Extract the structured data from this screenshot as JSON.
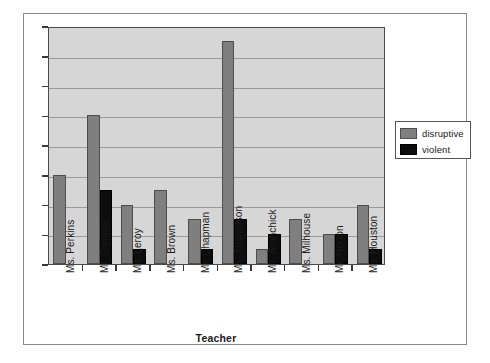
{
  "chart_data": {
    "type": "bar",
    "title": "",
    "xlabel": "Teacher",
    "ylabel": "",
    "ylim": [
      0,
      16
    ],
    "ytick_step": 2,
    "yticks": [
      "16",
      "14",
      "12",
      "10",
      "8",
      "6",
      "4",
      "2",
      "0"
    ],
    "grid": true,
    "legend_position": "right",
    "categories": [
      "Ms. Perkins",
      "Mr. Gilmore",
      "Ms. Leroy",
      "Ms. Brown",
      "Mr. Chapman",
      "Ms. Thompson",
      "Ms. Aronchick",
      "Ms. Milhouse",
      "Mr. Norton",
      "Ms. Houston"
    ],
    "series": [
      {
        "name": "disruptive",
        "color": "#7f7f7f",
        "values": [
          6,
          10,
          4,
          5,
          3,
          15,
          1,
          3,
          2,
          4
        ]
      },
      {
        "name": "violent",
        "color": "#0d0d0d",
        "values": [
          0,
          5,
          1,
          0,
          1,
          3,
          2,
          0,
          2,
          1
        ]
      }
    ]
  }
}
